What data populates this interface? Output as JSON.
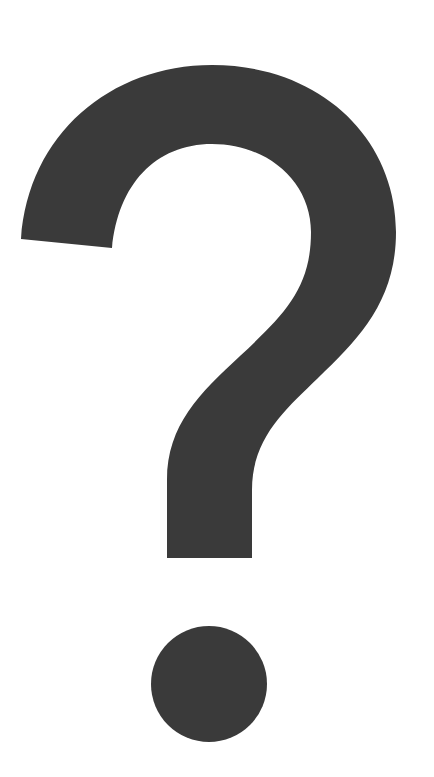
{
  "image": {
    "glyph": "?",
    "label": "Question mark",
    "icon": "question-mark-icon",
    "colors": {
      "background": "#ffffff",
      "glyph": "#3a3a3a"
    }
  }
}
